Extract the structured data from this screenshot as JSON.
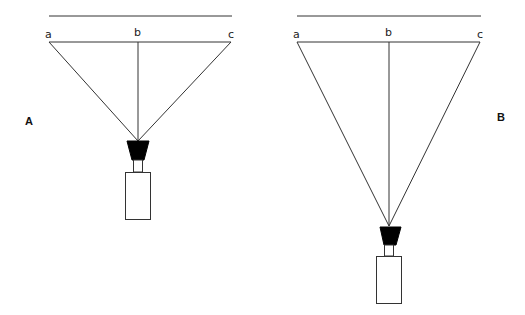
{
  "diagram": {
    "panels": [
      {
        "id": "A",
        "label": "A",
        "points": {
          "a": "a",
          "b": "b",
          "c": "c"
        }
      },
      {
        "id": "B",
        "label": "B",
        "points": {
          "a": "a",
          "b": "b",
          "c": "c"
        }
      }
    ],
    "colors": {
      "line": "#333333",
      "lens": "#000000",
      "background": "#ffffff"
    }
  }
}
